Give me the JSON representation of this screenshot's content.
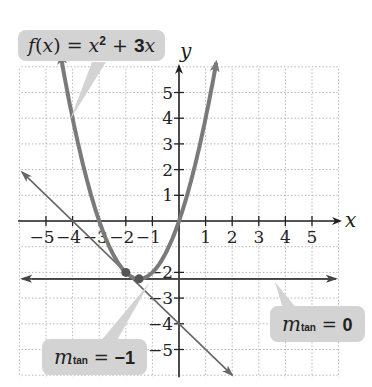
{
  "chart_data": {
    "type": "line",
    "title": "",
    "xlabel": "x",
    "ylabel": "y",
    "xlim": [
      -6,
      6
    ],
    "ylim": [
      -6,
      6
    ],
    "grid": true,
    "x_ticks": [
      -5,
      -4,
      -3,
      -2,
      -1,
      1,
      2,
      3,
      4,
      5
    ],
    "y_ticks": [
      -5,
      -4,
      -3,
      -2,
      1,
      2,
      3,
      4,
      5
    ],
    "x_tick_labels": [
      "−5",
      "−4",
      "−3",
      "−2",
      "−1",
      "1",
      "2",
      "3",
      "4",
      "5"
    ],
    "y_tick_labels": [
      "−5",
      "−4",
      "−3",
      "−2",
      "1",
      "2",
      "3",
      "4",
      "5"
    ],
    "series": [
      {
        "name": "f(x) = x² + 3x",
        "kind": "curve",
        "color": "#7a7a7a",
        "x": [
          -4.4,
          -4,
          -3.5,
          -3,
          -2.5,
          -2,
          -1.5,
          -1,
          -0.5,
          0,
          0.5,
          1.2
        ],
        "y": [
          6.16,
          4,
          1.75,
          0,
          -1.25,
          -2,
          -2.25,
          -2,
          -1.25,
          0,
          1.75,
          5.04
        ]
      },
      {
        "name": "tangent m_tan = −1",
        "kind": "line",
        "equation": "y = −x − 4",
        "color": "#666666",
        "x": [
          -5.9,
          2.0
        ],
        "y": [
          1.9,
          -6.0
        ]
      },
      {
        "name": "tangent m_tan = 0",
        "kind": "line",
        "equation": "y = −2.25",
        "color": "#444444",
        "x": [
          -5.9,
          5.9
        ],
        "y": [
          -2.25,
          -2.25
        ]
      }
    ],
    "points": [
      {
        "x": -2,
        "y": -2,
        "label": "point of tangency, slope −1"
      },
      {
        "x": -1.5,
        "y": -2.25,
        "label": "vertex, slope 0"
      }
    ],
    "annotations": [
      {
        "text": "f(x) = x² + 3x",
        "target": "curve"
      },
      {
        "text": "m_tan = 0",
        "target": "horizontal tangent"
      },
      {
        "text": "m_tan = −1",
        "target": "slanted tangent"
      }
    ]
  },
  "labels": {
    "function": {
      "f": "f",
      "open": "(",
      "x": "x",
      "close": ")",
      "eq": " = ",
      "x2": "x",
      "exp": "2",
      "plus": " + ",
      "coef": "3",
      "x3": "x"
    },
    "m0": {
      "m": "m",
      "sub": "tan",
      "eq": " = ",
      "val": "0"
    },
    "m1": {
      "m": "m",
      "sub": "tan",
      "eq": " = ",
      "val": "−1"
    },
    "x_axis": "x",
    "y_axis": "y"
  },
  "style": {
    "curve_color": "#7a7a7a",
    "tangent_color": "#666666",
    "hline_color": "#444444",
    "axis_color": "#222222",
    "grid_color": "#b5b5b5",
    "callout_bg": "#d3d3d3"
  }
}
